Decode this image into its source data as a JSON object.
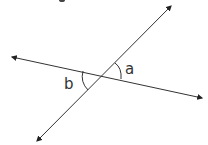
{
  "diagram": {
    "type": "intersecting-lines",
    "lines": [
      {
        "name": "line-1",
        "label": "",
        "arrows": "both"
      },
      {
        "name": "line-2",
        "label": "",
        "arrows": "both"
      }
    ],
    "angles": [
      {
        "name": "angle-a",
        "label": "a",
        "position": "right, above line 1, below line 2"
      },
      {
        "name": "angle-b",
        "label": "b",
        "position": "left, below line 1, above line 2"
      }
    ],
    "relationship": "a and b are vertical angles",
    "colors": {
      "stroke": "#333333",
      "background": "#ffffff"
    }
  }
}
